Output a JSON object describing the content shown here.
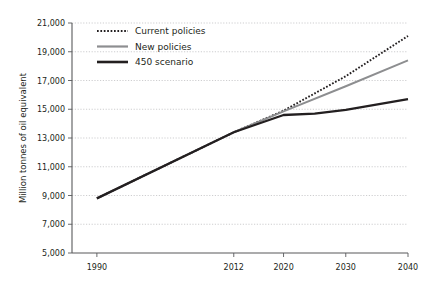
{
  "chart_data": {
    "type": "line",
    "title": "",
    "subtitle": "",
    "xlabel": "",
    "ylabel": "Million tonnes of oil equivalent",
    "x": [
      1990,
      2012,
      2020,
      2030,
      2040
    ],
    "xtick_labels": [
      "1990",
      "2012",
      "2020",
      "2030",
      "2040"
    ],
    "xlim": [
      1986,
      2040
    ],
    "ylim": [
      5000,
      21000
    ],
    "ytick_labels": [
      "5,000",
      "7,000",
      "9,000",
      "11,000",
      "13,000",
      "15,000",
      "17,000",
      "19,000",
      "21,000"
    ],
    "ytick_values": [
      5000,
      7000,
      9000,
      11000,
      13000,
      15000,
      17000,
      19000,
      21000
    ],
    "grid": "horizontal-dotted",
    "legend_position": "top-left-inside",
    "series": [
      {
        "name": "Current policies",
        "style": "dotted",
        "color": "#231f20",
        "width": 1.9,
        "x": [
          1990,
          2012,
          2020,
          2030,
          2040
        ],
        "values": [
          8800,
          13400,
          14900,
          17300,
          20100
        ]
      },
      {
        "name": "New policies",
        "style": "solid",
        "color": "#8d8e90",
        "width": 1.9,
        "x": [
          1990,
          2012,
          2020,
          2030,
          2040
        ],
        "values": [
          8800,
          13400,
          14850,
          16600,
          18400
        ]
      },
      {
        "name": "450 scenario",
        "style": "solid",
        "color": "#231f20",
        "width": 2.3,
        "x": [
          1990,
          2012,
          2020,
          2025,
          2030,
          2040
        ],
        "values": [
          8800,
          13400,
          14600,
          14700,
          14950,
          15700
        ]
      }
    ]
  },
  "legend": {
    "items": [
      {
        "label": "Current policies"
      },
      {
        "label": "New policies"
      },
      {
        "label": "450 scenario"
      }
    ]
  },
  "colors": {
    "background": "#ffffff",
    "ink": "#231f20",
    "gray_series": "#8d8e90",
    "gridline": "#b9b9bb",
    "axis": "#58595b"
  }
}
